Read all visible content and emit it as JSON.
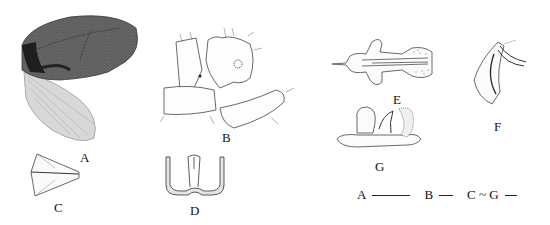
{
  "figure": {
    "panels": [
      {
        "id": "A",
        "label": "A",
        "subject": "forewing and hindwing"
      },
      {
        "id": "B",
        "label": "B",
        "subject": "male genitalia, lateral view"
      },
      {
        "id": "C",
        "label": "C",
        "subject": "sclerite"
      },
      {
        "id": "D",
        "label": "D",
        "subject": "sclerite, U-shaped structure"
      },
      {
        "id": "E",
        "label": "E",
        "subject": "aedeagus, dorsal view"
      },
      {
        "id": "F",
        "label": "F",
        "subject": "paramere"
      },
      {
        "id": "G",
        "label": "G",
        "subject": "aedeagus, lateral view"
      }
    ],
    "scale_bars": [
      {
        "label": "A",
        "length_px": 38
      },
      {
        "label": "B",
        "length_px": 14
      },
      {
        "label": "C ~ G",
        "length_px": 12
      }
    ]
  }
}
